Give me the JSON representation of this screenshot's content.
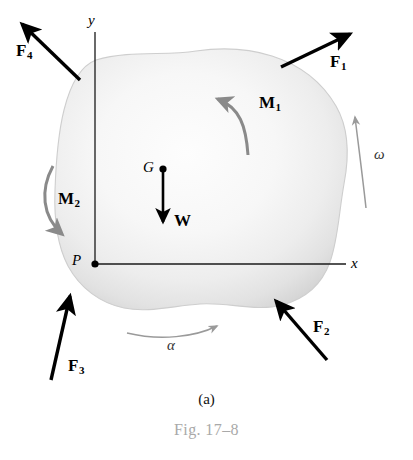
{
  "figure": {
    "subcaption": "(a)",
    "caption": "Fig. 17–8",
    "colors": {
      "body_fill_center": "#fcfcfc",
      "body_fill_edge": "#d6d6d6",
      "body_outline": "#cfcfcf",
      "force_arrow": "#000000",
      "moment_arrow": "#8a8a8a",
      "motion_arrow": "#9a9a9a",
      "axis": "#1a1a1a",
      "caption_gray": "#a9a9a9"
    }
  },
  "axes": {
    "y_label": "y",
    "x_label": "x",
    "origin_label": "P"
  },
  "points": [
    {
      "id": "center-of-gravity",
      "label": "G"
    },
    {
      "id": "origin",
      "label": "P"
    }
  ],
  "forces": [
    {
      "id": "F1",
      "label": "F",
      "subscript": "1",
      "direction": "up-right",
      "applied_at": "upper-right-edge"
    },
    {
      "id": "F2",
      "label": "F",
      "subscript": "2",
      "direction": "up-left",
      "applied_at": "lower-right-edge"
    },
    {
      "id": "F3",
      "label": "F",
      "subscript": "3",
      "direction": "up-right",
      "applied_at": "lower-left-edge"
    },
    {
      "id": "F4",
      "label": "F",
      "subscript": "4",
      "direction": "up-left",
      "applied_at": "upper-left-edge"
    },
    {
      "id": "W",
      "label": "W",
      "subscript": "",
      "direction": "down",
      "applied_at": "center-of-gravity"
    }
  ],
  "moments": [
    {
      "id": "M1",
      "label": "M",
      "subscript": "1",
      "sense": "counterclockwise",
      "location": "upper-right-interior"
    },
    {
      "id": "M2",
      "label": "M",
      "subscript": "2",
      "sense": "clockwise",
      "location": "left-interior"
    }
  ],
  "motion": [
    {
      "id": "omega",
      "label": "ω",
      "sense": "counterclockwise",
      "location": "right-exterior"
    },
    {
      "id": "alpha",
      "label": "α",
      "sense": "counterclockwise",
      "location": "bottom-exterior"
    }
  ]
}
